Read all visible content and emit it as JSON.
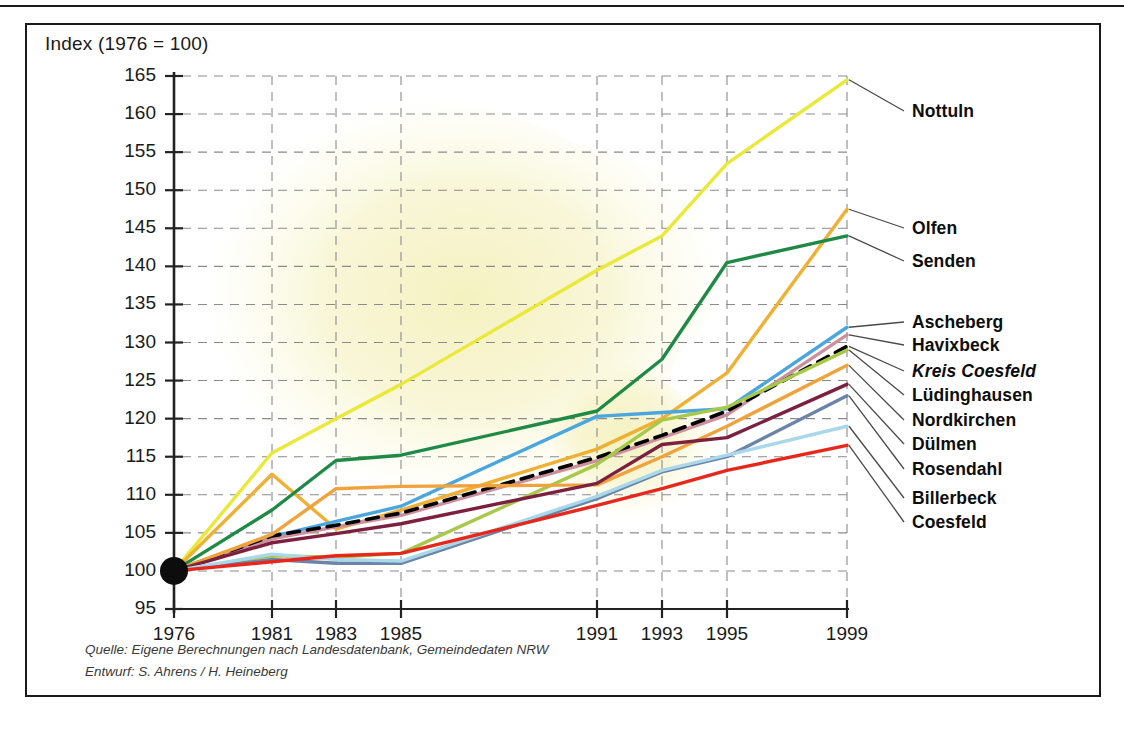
{
  "figure": {
    "axis_title": "Index (1976  = 100)",
    "source_line1": "Quelle: Eigene Berechnungen nach Landesdatenbank, Gemeindedaten NRW",
    "source_line2": "Entwurf: S. Ahrens / H. Heineberg"
  },
  "chart_data": {
    "type": "line",
    "title": "Index (1976  = 100)",
    "xlabel": "",
    "ylabel": "Index (1976 = 100)",
    "xlim": [
      1976,
      1999
    ],
    "ylim": [
      95,
      165
    ],
    "grid": true,
    "legend_position": "right-inline-labels",
    "x_ticks": [
      1976,
      1981,
      1983,
      1985,
      1991,
      1993,
      1995,
      1999
    ],
    "x_tick_labels": [
      "1976",
      "1981",
      "1983",
      "1985",
      "1991",
      "1993",
      "1995",
      "1999"
    ],
    "y_ticks": [
      95,
      100,
      105,
      110,
      115,
      120,
      125,
      130,
      135,
      140,
      145,
      150,
      155,
      160,
      165
    ],
    "y_tick_labels": [
      "95",
      "100",
      "105",
      "110",
      "115",
      "120",
      "125",
      "130",
      "135",
      "140",
      "145",
      "150",
      "155",
      "160",
      "165"
    ],
    "x": [
      1976,
      1981,
      1983,
      1985,
      1991,
      1993,
      1995,
      1999
    ],
    "series": [
      {
        "name": "Nottuln",
        "color": "#eae838",
        "dash": false,
        "width": 3.4,
        "label_y": 164.5,
        "values": [
          100.0,
          115.5,
          120.0,
          124.5,
          139.5,
          144.0,
          153.5,
          164.5
        ]
      },
      {
        "name": "Olfen",
        "color": "#f0b033",
        "dash": false,
        "width": 3.4,
        "label_y": 147.5,
        "values": [
          100.0,
          112.7,
          105.5,
          108.0,
          116.0,
          120.0,
          126.0,
          147.5
        ]
      },
      {
        "name": "Senden",
        "color": "#1f8a45",
        "dash": false,
        "width": 3.4,
        "label_y": 144.0,
        "values": [
          100.0,
          108.0,
          114.5,
          115.2,
          121.0,
          127.8,
          140.5,
          144.0
        ]
      },
      {
        "name": "Ascheberg",
        "color": "#4aa6de",
        "dash": false,
        "width": 3.4,
        "label_y": 132.0,
        "values": [
          100.0,
          104.5,
          106.5,
          108.5,
          120.3,
          120.8,
          121.3,
          132.0
        ]
      },
      {
        "name": "Havixbeck",
        "color": "#cc8f9b",
        "dash": false,
        "width": 3.4,
        "label_y": 131.0,
        "values": [
          100.0,
          104.2,
          105.8,
          107.3,
          114.5,
          117.5,
          120.5,
          131.0
        ]
      },
      {
        "name": "Kreis Coesfeld",
        "color": "#000000",
        "dash": true,
        "width": 3.6,
        "label_y": 129.5,
        "italic": true,
        "values": [
          100.0,
          104.6,
          106.0,
          107.6,
          114.9,
          117.8,
          121.0,
          129.5
        ]
      },
      {
        "name": "Lüdinghausen",
        "color": "#a8c84a",
        "dash": false,
        "width": 3.4,
        "label_y": 129.0,
        "values": [
          100.0,
          102.0,
          101.8,
          102.3,
          114.0,
          119.8,
          121.5,
          129.0
        ]
      },
      {
        "name": "Nordkirchen",
        "color": "#f0a23c",
        "dash": false,
        "width": 3.4,
        "label_y": 127.0,
        "values": [
          100.0,
          104.8,
          110.8,
          111.1,
          111.3,
          115.0,
          119.0,
          127.0
        ]
      },
      {
        "name": "Dülmen",
        "color": "#7d2040",
        "dash": false,
        "width": 3.4,
        "label_y": 124.5,
        "values": [
          100.0,
          103.7,
          104.9,
          106.2,
          111.5,
          116.6,
          117.5,
          124.5
        ]
      },
      {
        "name": "Rosendahl",
        "color": "#6b84a8",
        "dash": false,
        "width": 3.4,
        "label_y": 123.0,
        "values": [
          100.0,
          101.5,
          101.0,
          101.0,
          109.5,
          113.0,
          115.0,
          123.0
        ]
      },
      {
        "name": "Billerbeck",
        "color": "#a8d8ea",
        "dash": false,
        "width": 3.4,
        "label_y": 119.0,
        "values": [
          100.0,
          102.2,
          101.5,
          101.3,
          109.8,
          113.2,
          115.2,
          119.0
        ]
      },
      {
        "name": "Coesfeld",
        "color": "#e8271c",
        "dash": false,
        "width": 3.4,
        "label_y": 116.5,
        "values": [
          100.0,
          101.2,
          102.0,
          102.3,
          108.6,
          110.8,
          113.2,
          116.5
        ]
      }
    ],
    "origin_marker": {
      "x": 1976,
      "y": 100,
      "color": "#0d0d0d",
      "radius": 14
    }
  }
}
